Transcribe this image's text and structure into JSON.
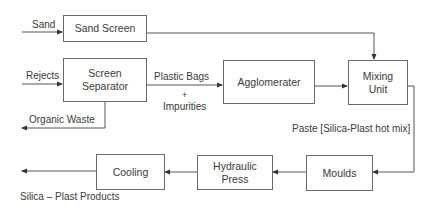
{
  "diagram": {
    "type": "process-flow",
    "nodes": {
      "sand_screen": {
        "label": "Sand Screen"
      },
      "screen_separator": {
        "label": "Screen Separator",
        "line1": "Screen",
        "line2": "Separator"
      },
      "agglomerater": {
        "label": "Agglomerater"
      },
      "mixing_unit": {
        "label": "Mixing Unit",
        "line1": "Mixing",
        "line2": "Unit"
      },
      "moulds": {
        "label": "Moulds"
      },
      "hydraulic_press": {
        "label": "Hydraulic Press",
        "line1": "Hydraulic",
        "line2": "Press"
      },
      "cooling": {
        "label": "Cooling"
      }
    },
    "edge_labels": {
      "sand_input": "Sand",
      "rejects_input": "Rejects",
      "plastic_bags": "Plastic Bags",
      "plus": "+",
      "impurities": "Impurities",
      "organic_waste": "Organic Waste",
      "paste": "Paste [Silica-Plast hot mix]",
      "products": "Silica – Plast  Products"
    },
    "edges": [
      {
        "from": "Sand",
        "to": "Sand Screen"
      },
      {
        "from": "Sand Screen",
        "to": "Mixing Unit"
      },
      {
        "from": "Rejects",
        "to": "Screen Separator"
      },
      {
        "from": "Screen Separator",
        "to": "Agglomerater",
        "label": "Plastic Bags + Impurities"
      },
      {
        "from": "Screen Separator",
        "to": "Organic Waste"
      },
      {
        "from": "Agglomerater",
        "to": "Mixing Unit"
      },
      {
        "from": "Mixing Unit",
        "to": "Moulds",
        "label": "Paste [Silica-Plast hot mix]"
      },
      {
        "from": "Moulds",
        "to": "Hydraulic Press"
      },
      {
        "from": "Hydraulic Press",
        "to": "Cooling"
      },
      {
        "from": "Cooling",
        "to": "Silica – Plast Products"
      }
    ]
  }
}
